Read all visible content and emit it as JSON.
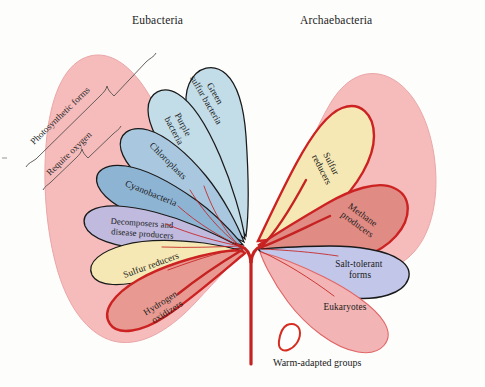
{
  "figure": {
    "background_color": "#fdfdfc"
  },
  "headings": {
    "eubacteria": "Eubacteria",
    "archaebacteria": "Archaebacteria"
  },
  "brackets": [
    {
      "id": "photosynthetic",
      "label": "Photosynthetic forms"
    },
    {
      "id": "require-oxygen",
      "label": "Require oxygen"
    }
  ],
  "key": {
    "label": "Warm-adapted groups",
    "swatch_color": "#ffffff",
    "swatch_outline": "#d62d20"
  },
  "colors": {
    "clade_background": "#f6bcbc",
    "clade_background_outline": "#e8a0a0",
    "light_blue": "#c2dce8",
    "mid_blue": "#a9c8df",
    "steel_blue": "#8eb4d4",
    "lavender": "#c0bade",
    "cream": "#f5e8b4",
    "salmon": "#e89a92",
    "periwinkle": "#c2c6e8",
    "pink_petal": "#f2b4b4",
    "warm_outline": "#cc2222",
    "cool_outline": "#1a1a1a",
    "trunk": "#c52222"
  },
  "eubacteria_groups": [
    {
      "name": "Green sulfur bacteria",
      "lines": [
        "Green",
        "sulfur bacteria"
      ],
      "fill": "#c2dce8",
      "outline": "cool",
      "warm_adapted": false
    },
    {
      "name": "Purple bacteria",
      "lines": [
        "Purple",
        "bacteria"
      ],
      "fill": "#c2dce8",
      "outline": "cool",
      "warm_adapted": false
    },
    {
      "name": "Chloroplasts",
      "lines": [
        "Chloroplasts"
      ],
      "fill": "#a9c8df",
      "outline": "cool",
      "warm_adapted": false
    },
    {
      "name": "Cyanobacteria",
      "lines": [
        "Cyanobacteria"
      ],
      "fill": "#8eb4d4",
      "outline": "cool",
      "warm_adapted": false
    },
    {
      "name": "Decomposers and disease producers",
      "lines": [
        "Decomposers and",
        "disease producers"
      ],
      "fill": "#c0bade",
      "outline": "cool",
      "warm_adapted": false
    },
    {
      "name": "Sulfur reducers",
      "lines": [
        "Sulfur reducers"
      ],
      "fill": "#f5e8b4",
      "outline": "cool",
      "warm_adapted": false
    },
    {
      "name": "Hydrogen oxidizers",
      "lines": [
        "Hydrogen",
        "oxidizers"
      ],
      "fill": "#e89a92",
      "outline": "warm",
      "warm_adapted": true
    }
  ],
  "archaebacteria_groups": [
    {
      "name": "Sulfur reducers",
      "lines": [
        "Sulfur",
        "reducers"
      ],
      "fill": "#f5e8b4",
      "outline": "warm",
      "warm_adapted": true
    },
    {
      "name": "Methane producers",
      "lines": [
        "Methane",
        "producers"
      ],
      "fill": "#e08b84",
      "outline": "warm",
      "warm_adapted": true
    },
    {
      "name": "Salt-tolerant forms",
      "lines": [
        "Salt-tolerant",
        "forms"
      ],
      "fill": "#c2c6e8",
      "outline": "cool",
      "warm_adapted": false
    }
  ],
  "eukaryote_groups": [
    {
      "name": "Eukaryotes",
      "lines": [
        "Eukaryotes"
      ],
      "fill": "#f2b4b4",
      "outline": "pink",
      "warm_adapted": false
    }
  ]
}
